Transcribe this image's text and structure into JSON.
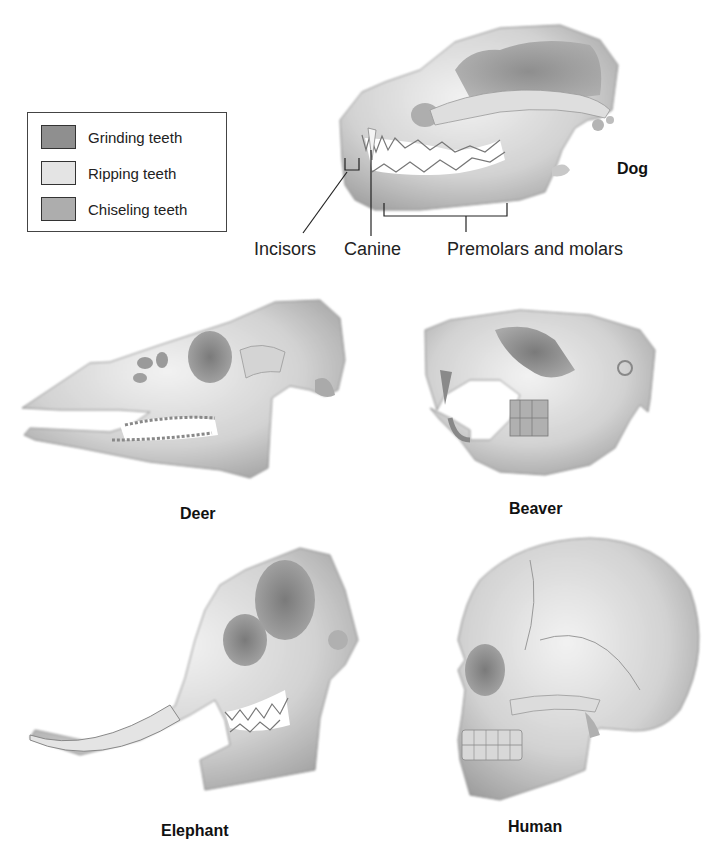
{
  "legend": {
    "items": [
      {
        "label": "Grinding teeth",
        "color": "#8f8f8f"
      },
      {
        "label": "Ripping teeth",
        "color": "#e4e4e4"
      },
      {
        "label": "Chiseling teeth",
        "color": "#adadad"
      }
    ]
  },
  "dog": {
    "name": "Dog",
    "labels": {
      "incisors": "Incisors",
      "canine": "Canine",
      "premolars_molars": "Premolars and molars"
    }
  },
  "species": {
    "deer": "Deer",
    "beaver": "Beaver",
    "elephant": "Elephant",
    "human": "Human"
  },
  "colors": {
    "bone_light": "#eeeeee",
    "bone_mid": "#c8c8c8",
    "bone_dark": "#9a9a9a",
    "line": "#333333"
  }
}
